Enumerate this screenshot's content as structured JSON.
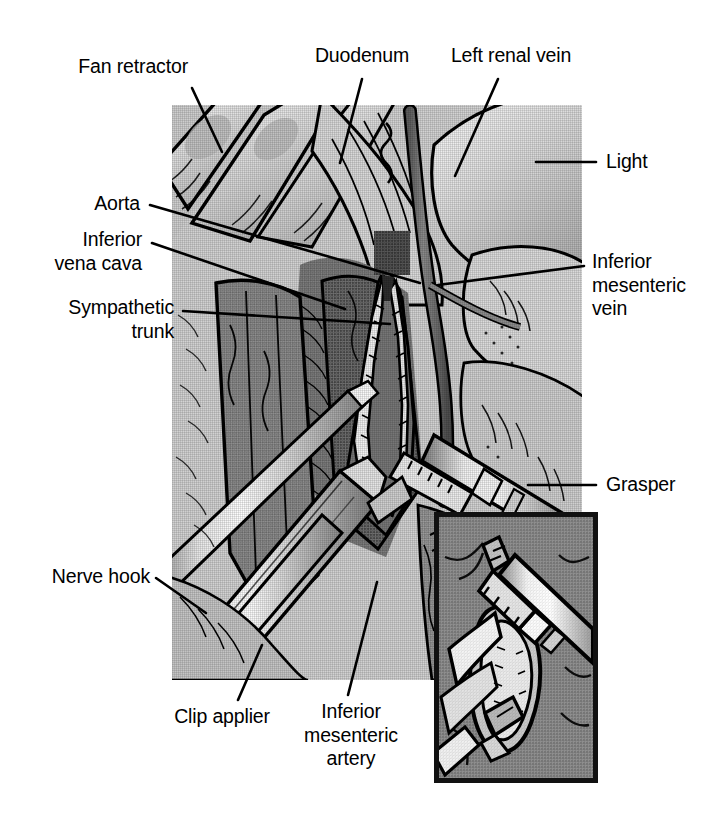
{
  "figure": {
    "kind": "surgical-illustration",
    "palette": {
      "ink": "#000000",
      "page_background": "#ffffff",
      "tissue_light": "#d6d6d6",
      "tissue_mid": "#9b9b9b",
      "tissue_dark": "#6d6d6d",
      "tissue_darkest": "#4a4a4a",
      "instrument_highlight": "#ffffff",
      "inset_border": "#111111"
    }
  },
  "labels": [
    {
      "id": "fan-retractor",
      "text": "Fan retractor"
    },
    {
      "id": "duodenum",
      "text": "Duodenum"
    },
    {
      "id": "left-renal-vein",
      "text": "Left renal vein"
    },
    {
      "id": "light",
      "text": "Light"
    },
    {
      "id": "aorta",
      "text": "Aorta"
    },
    {
      "id": "inferior-vena-cava",
      "text": "Inferior\nvena cava"
    },
    {
      "id": "sympathetic-trunk",
      "text": "Sympathetic\ntrunk"
    },
    {
      "id": "inferior-mesenteric-vein",
      "text": "Inferior\nmesenteric\nvein"
    },
    {
      "id": "grasper",
      "text": "Grasper"
    },
    {
      "id": "nerve-hook",
      "text": "Nerve hook"
    },
    {
      "id": "clip-applier",
      "text": "Clip applier"
    },
    {
      "id": "inferior-mesenteric-artery",
      "text": "Inferior\nmesenteric\nartery"
    }
  ],
  "panels": {
    "main": {
      "name": "operative-field-view"
    },
    "inset": {
      "name": "clip-applier-closeup"
    }
  }
}
